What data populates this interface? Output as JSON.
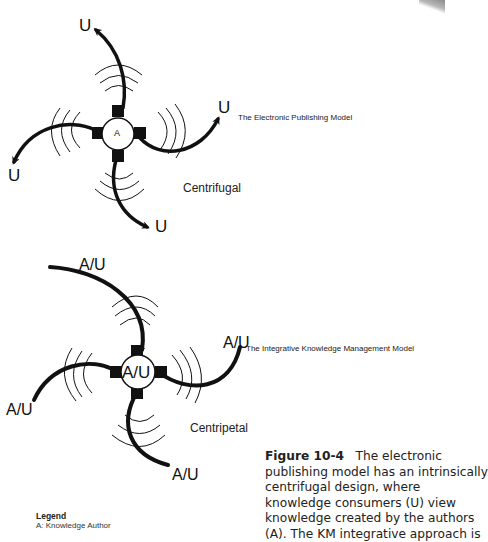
{
  "top_diagram": {
    "title": "The Electronic Publishing Model",
    "force_label": "Centrifugal",
    "center_label": "A",
    "arm_labels": [
      "U",
      "U",
      "U",
      "U"
    ],
    "direction": "outward"
  },
  "bottom_diagram": {
    "title": "The Integrative Knowledge Management Model",
    "force_label": "Centripetal",
    "center_label": "A/U",
    "arm_labels": [
      "A/U",
      "A/U",
      "A/U",
      "A/U"
    ],
    "direction": "inward"
  },
  "legend": {
    "title": "Legend",
    "items": [
      "A: Knowledge Author"
    ]
  },
  "caption": {
    "figure_label": "Figure 10-4",
    "lines": [
      "The electronic",
      "publishing model has an intrinsically",
      "centrifugal design, where",
      "knowledge consumers (U) view",
      "knowledge created by the authors",
      "(A). The KM integrative approach is"
    ]
  },
  "colors": {
    "ink": "#111111",
    "background": "#ffffff"
  }
}
